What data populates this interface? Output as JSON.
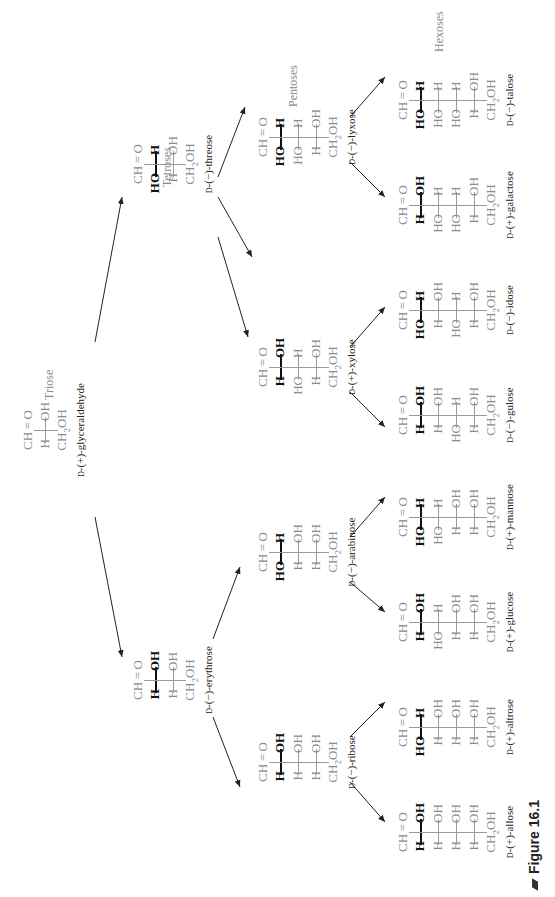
{
  "figure": {
    "caption": "Figure 16.1",
    "groups": {
      "triose": "Triose",
      "tetroses": "Tetroses",
      "pentoses": "Pentoses",
      "hexoses": "Hexoses"
    },
    "common": {
      "top": "CH = O",
      "bottom_main": "CH",
      "bottom_sub": "2",
      "bottom_tail": "OH"
    },
    "sugars": [
      {
        "id": "glyceraldehyde",
        "prefix": "D",
        "name": "-(+)-glyceraldehyde",
        "rows": [
          [
            "H",
            "OH"
          ]
        ]
      },
      {
        "id": "erythrose",
        "prefix": "D",
        "name": "-(−)-erythrose",
        "rows": [
          [
            "H",
            "OH"
          ],
          [
            "H",
            "OH"
          ]
        ]
      },
      {
        "id": "threose",
        "prefix": "D",
        "name": "-(−)-threose",
        "rows": [
          [
            "HO",
            "H"
          ],
          [
            "H",
            "OH"
          ]
        ]
      },
      {
        "id": "ribose",
        "prefix": "D",
        "name": "-(−)-ribose",
        "rows": [
          [
            "H",
            "OH"
          ],
          [
            "H",
            "OH"
          ],
          [
            "H",
            "OH"
          ]
        ]
      },
      {
        "id": "arabinose",
        "prefix": "D",
        "name": "-(−)-arabinose",
        "rows": [
          [
            "HO",
            "H"
          ],
          [
            "H",
            "OH"
          ],
          [
            "H",
            "OH"
          ]
        ]
      },
      {
        "id": "xylose",
        "prefix": "D",
        "name": "-(+)-xylose",
        "rows": [
          [
            "H",
            "OH"
          ],
          [
            "HO",
            "H"
          ],
          [
            "H",
            "OH"
          ]
        ]
      },
      {
        "id": "lyxose",
        "prefix": "D",
        "name": "-(−)-lyxose",
        "rows": [
          [
            "HO",
            "H"
          ],
          [
            "HO",
            "H"
          ],
          [
            "H",
            "OH"
          ]
        ]
      },
      {
        "id": "allose",
        "prefix": "D",
        "name": "-(+)-allose",
        "rows": [
          [
            "H",
            "OH"
          ],
          [
            "H",
            "OH"
          ],
          [
            "H",
            "OH"
          ],
          [
            "H",
            "OH"
          ]
        ]
      },
      {
        "id": "altrose",
        "prefix": "D",
        "name": "-(+)-altrose",
        "rows": [
          [
            "HO",
            "H"
          ],
          [
            "H",
            "OH"
          ],
          [
            "H",
            "OH"
          ],
          [
            "H",
            "OH"
          ]
        ]
      },
      {
        "id": "glucose",
        "prefix": "D",
        "name": "-(+)-glucose",
        "rows": [
          [
            "H",
            "OH"
          ],
          [
            "HO",
            "H"
          ],
          [
            "H",
            "OH"
          ],
          [
            "H",
            "OH"
          ]
        ]
      },
      {
        "id": "mannose",
        "prefix": "D",
        "name": "-(+)-mannose",
        "rows": [
          [
            "HO",
            "H"
          ],
          [
            "HO",
            "H"
          ],
          [
            "H",
            "OH"
          ],
          [
            "H",
            "OH"
          ]
        ]
      },
      {
        "id": "gulose",
        "prefix": "D",
        "name": "-(−)-gulose",
        "rows": [
          [
            "H",
            "OH"
          ],
          [
            "H",
            "OH"
          ],
          [
            "HO",
            "H"
          ],
          [
            "H",
            "OH"
          ]
        ]
      },
      {
        "id": "idose",
        "prefix": "D",
        "name": "-(−)-idose",
        "rows": [
          [
            "HO",
            "H"
          ],
          [
            "H",
            "OH"
          ],
          [
            "HO",
            "H"
          ],
          [
            "H",
            "OH"
          ]
        ]
      },
      {
        "id": "galactose",
        "prefix": "D",
        "name": "-(+)-galactose",
        "rows": [
          [
            "H",
            "OH"
          ],
          [
            "HO",
            "H"
          ],
          [
            "HO",
            "H"
          ],
          [
            "H",
            "OH"
          ]
        ]
      },
      {
        "id": "talose",
        "prefix": "D",
        "name": "-(−)-talose",
        "rows": [
          [
            "HO",
            "H"
          ],
          [
            "HO",
            "H"
          ],
          [
            "HO",
            "H"
          ],
          [
            "H",
            "OH"
          ]
        ]
      }
    ],
    "colors": {
      "new_stereocenter": "#111111",
      "inherited": "#8a8a8a",
      "labels": "#222222"
    }
  }
}
